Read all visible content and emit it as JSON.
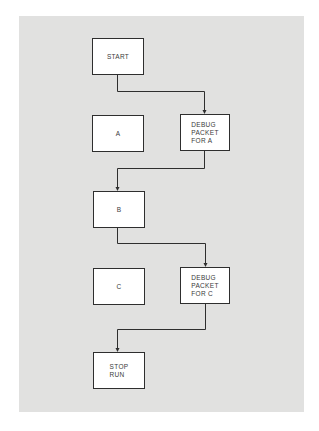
{
  "diagram": {
    "type": "flowchart",
    "colors": {
      "background": "#e1e1e0",
      "box_fill": "#ffffff",
      "stroke": "#2e2e2e",
      "text": "#3a3a3a"
    },
    "nodes": [
      {
        "id": "start",
        "label": "START"
      },
      {
        "id": "a",
        "label": "A"
      },
      {
        "id": "debug_a",
        "label": "DEBUG\nPACKET\nFOR A"
      },
      {
        "id": "b",
        "label": "B"
      },
      {
        "id": "c",
        "label": "C"
      },
      {
        "id": "debug_c",
        "label": "DEBUG\nPACKET\nFOR C"
      },
      {
        "id": "stop",
        "label": "STOP\nRUN"
      }
    ],
    "edges": [
      {
        "from": "start",
        "to": "debug_a"
      },
      {
        "from": "debug_a",
        "to": "b"
      },
      {
        "from": "b",
        "to": "debug_c"
      },
      {
        "from": "debug_c",
        "to": "stop"
      }
    ]
  }
}
